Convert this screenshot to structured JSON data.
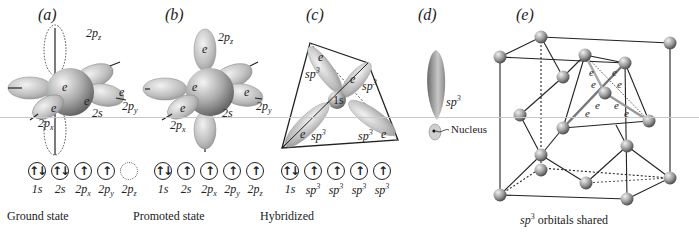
{
  "panels": {
    "a": {
      "label": "(a)",
      "orbital_labels": {
        "pz": "2p",
        "pz_sub": "z",
        "py": "2p",
        "py_sub": "y",
        "px": "2p",
        "px_sub": "x",
        "s": "2s"
      },
      "electron": "e"
    },
    "b": {
      "label": "(b)",
      "orbital_labels": {
        "pz": "2p",
        "pz_sub": "z",
        "py": "2p",
        "py_sub": "y",
        "px": "2p",
        "px_sub": "x",
        "s": "2s"
      },
      "electron": "e"
    },
    "c": {
      "label": "(c)",
      "core": "1s",
      "hybrid": "sp",
      "hybrid_sup": "3",
      "electron": "e"
    },
    "d": {
      "label": "(d)",
      "hybrid": "sp",
      "hybrid_sup": "3",
      "nucleus": "Nucleus"
    },
    "e": {
      "label": "(e)",
      "electron": "e",
      "caption_italic": "sp",
      "caption_sup": "3",
      "caption_rest": " orbitals shared"
    }
  },
  "configurations": [
    {
      "caption": "Ground state",
      "boxes": [
        {
          "arrows": "↑↓",
          "label": "1s"
        },
        {
          "arrows": "↑↓",
          "label": "2s"
        },
        {
          "arrows": "↑",
          "label": "2p",
          "sub": "x"
        },
        {
          "arrows": "↑",
          "label": "2p",
          "sub": "y"
        },
        {
          "arrows": "",
          "label": "2p",
          "sub": "z",
          "empty": true
        }
      ]
    },
    {
      "caption": "Promoted state",
      "boxes": [
        {
          "arrows": "↑↓",
          "label": "1s"
        },
        {
          "arrows": "↑",
          "label": "2s"
        },
        {
          "arrows": "↑",
          "label": "2p",
          "sub": "x"
        },
        {
          "arrows": "↑",
          "label": "2p",
          "sub": "y"
        },
        {
          "arrows": "↑",
          "label": "2p",
          "sub": "z"
        }
      ]
    },
    {
      "caption": "Hybridized",
      "boxes": [
        {
          "arrows": "↑↓",
          "label": "1s"
        },
        {
          "arrows": "↑",
          "label": "sp",
          "sup": "3"
        },
        {
          "arrows": "↑",
          "label": "sp",
          "sup": "3"
        },
        {
          "arrows": "↑",
          "label": "sp",
          "sup": "3"
        },
        {
          "arrows": "↑",
          "label": "sp",
          "sup": "3"
        }
      ]
    }
  ]
}
